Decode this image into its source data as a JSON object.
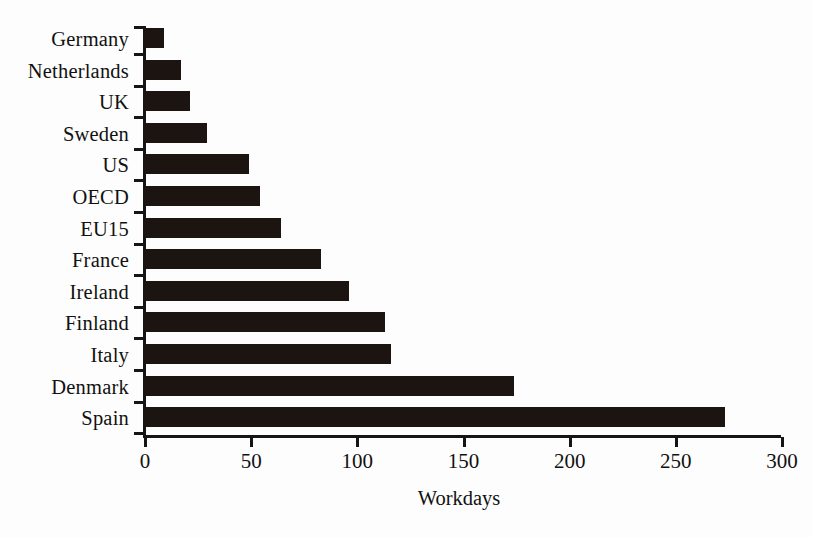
{
  "chart_data": {
    "type": "bar",
    "orientation": "horizontal",
    "title": "",
    "subtitle": "",
    "xlabel": "Workdays",
    "ylabel": "",
    "xlim": [
      0,
      300
    ],
    "xticks": [
      0,
      50,
      100,
      150,
      200,
      250,
      300
    ],
    "xtick_labels": [
      "0",
      "50",
      "100",
      "150",
      "200",
      "250",
      "300"
    ],
    "grid": false,
    "legend": null,
    "categories": [
      "Germany",
      "Netherlands",
      "UK",
      "Sweden",
      "US",
      "OECD",
      "EU15",
      "France",
      "Ireland",
      "Finland",
      "Italy",
      "Denmark",
      "Spain"
    ],
    "values": [
      9,
      17,
      21,
      29,
      49,
      54,
      64,
      83,
      96,
      113,
      116,
      174,
      273
    ],
    "series": [
      {
        "name": "Workdays",
        "values": [
          9,
          17,
          21,
          29,
          49,
          54,
          64,
          83,
          96,
          113,
          116,
          174,
          273
        ]
      }
    ],
    "colors": {
      "bar": "#1c1411",
      "axis": "#151515",
      "background": "#fdfdfd",
      "text": "#111111"
    }
  }
}
